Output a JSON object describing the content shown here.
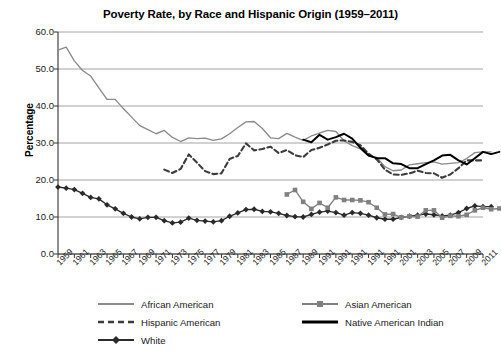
{
  "chart_data": {
    "type": "line",
    "title": "Poverty Rate, by Race and Hispanic Origin (1959–2011)",
    "xlabel": "",
    "ylabel": "Percentage",
    "ylim": [
      0.0,
      60.0
    ],
    "yticks": [
      "0.0",
      "10.0",
      "20.0",
      "30.0",
      "40.0",
      "50.0",
      "60.0"
    ],
    "ytick_values": [
      0,
      10,
      20,
      30,
      40,
      50,
      60
    ],
    "grid": "horizontal",
    "legend_position": "bottom",
    "x_start": 1959,
    "x_end": 2011,
    "xtick_labels": [
      "1959",
      "1961",
      "1963",
      "1965",
      "1967",
      "1969",
      "1971",
      "1973",
      "1975",
      "1977",
      "1979",
      "1981",
      "1983",
      "1985",
      "1987",
      "1989",
      "1991",
      "1991",
      "1991",
      "1991",
      "1991",
      "2001",
      "2003",
      "2005",
      "2007",
      "2009",
      "2011"
    ],
    "xtick_values": [
      1959,
      1961,
      1963,
      1965,
      1967,
      1969,
      1971,
      1973,
      1975,
      1977,
      1979,
      1981,
      1983,
      1985,
      1987,
      1989,
      1991,
      1993,
      1995,
      1997,
      1999,
      2001,
      2003,
      2005,
      2007,
      2009,
      2011
    ],
    "series": [
      {
        "name": "African American",
        "color": "#8a8a8a",
        "style": "solid",
        "marker": "none",
        "x_start": 1959,
        "values": [
          55.1,
          55.9,
          52.2,
          49.6,
          48.1,
          44.9,
          41.8,
          41.8,
          39.3,
          37.0,
          34.7,
          33.6,
          32.5,
          33.4,
          31.5,
          30.4,
          31.4,
          31.2,
          31.3,
          30.7,
          31.1,
          32.5,
          34.2,
          35.7,
          35.8,
          33.9,
          31.4,
          31.2,
          32.6,
          31.6,
          30.7,
          31.9,
          32.7,
          33.4,
          33.1,
          30.6,
          29.3,
          28.4,
          26.5,
          26.1,
          23.6,
          22.5,
          22.7,
          24.1,
          24.4,
          24.7,
          24.9,
          24.3,
          24.5,
          24.7,
          25.8,
          27.4,
          27.6,
          27.6
        ]
      },
      {
        "name": "Hispanic American",
        "color": "#3c3c3c",
        "style": "dashed",
        "marker": "none",
        "x_start": 1972,
        "values": [
          22.8,
          21.9,
          23.0,
          26.9,
          24.7,
          22.4,
          21.6,
          21.8,
          25.7,
          26.5,
          29.9,
          28.0,
          28.4,
          29.0,
          27.3,
          28.1,
          26.7,
          26.2,
          28.1,
          28.7,
          29.6,
          30.6,
          30.7,
          30.3,
          29.4,
          27.1,
          25.6,
          22.8,
          21.5,
          21.4,
          21.8,
          22.5,
          21.9,
          21.8,
          20.6,
          21.5,
          23.2,
          25.3,
          25.3,
          25.3
        ]
      },
      {
        "name": "White",
        "color": "#2a2a2a",
        "style": "solid",
        "marker": "diamond",
        "x_start": 1959,
        "values": [
          18.1,
          17.8,
          17.4,
          16.4,
          15.3,
          14.9,
          13.3,
          12.2,
          11.0,
          10.0,
          9.5,
          9.9,
          9.9,
          9.0,
          8.4,
          8.6,
          9.7,
          9.1,
          8.9,
          8.7,
          9.0,
          10.2,
          11.1,
          12.0,
          12.1,
          11.5,
          11.4,
          11.0,
          10.4,
          10.1,
          10.0,
          10.7,
          11.3,
          11.6,
          11.2,
          10.5,
          11.2,
          11.0,
          10.5,
          9.8,
          9.4,
          9.4,
          9.9,
          10.2,
          10.5,
          10.8,
          10.6,
          10.3,
          10.5,
          11.2,
          12.3,
          13.0,
          12.8,
          12.8
        ]
      },
      {
        "name": "Asian American",
        "color": "#808080",
        "style": "solid",
        "marker": "square",
        "x_start": 1987,
        "values": [
          16.1,
          17.3,
          14.1,
          12.2,
          13.8,
          12.5,
          15.3,
          14.6,
          14.6,
          14.5,
          14.0,
          12.5,
          10.7,
          10.8,
          9.9,
          10.2,
          10.1,
          11.8,
          11.8,
          9.8,
          10.3,
          10.2,
          10.6,
          11.8,
          12.5,
          12.1,
          12.3
        ]
      },
      {
        "name": "Native American Indian",
        "color": "#000000",
        "style": "solid",
        "marker": "none",
        "x_start": 1989,
        "values": [
          30.9,
          30.2,
          32.2,
          30.9,
          31.6,
          32.5,
          31.2,
          28.7,
          26.6,
          25.9,
          25.9,
          24.5,
          24.3,
          23.2,
          23.2,
          24.3,
          25.3,
          26.6,
          26.8,
          25.3,
          24.2,
          25.9,
          27.6,
          27.0,
          27.6
        ]
      }
    ]
  },
  "legend": {
    "items": [
      {
        "label": "African American",
        "swatch": "line-gray-solid"
      },
      {
        "label": "Asian American",
        "swatch": "line-gray-square"
      },
      {
        "label": "Hispanic American",
        "swatch": "line-dark-dashed"
      },
      {
        "label": "Native American Indian",
        "swatch": "line-black-solid"
      },
      {
        "label": "White",
        "swatch": "line-dark-diamond"
      }
    ]
  }
}
